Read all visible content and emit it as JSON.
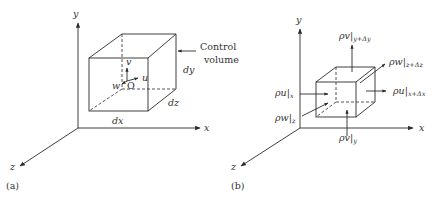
{
  "panel_a": {
    "label": "(a)",
    "axes": {
      "x": "x",
      "y": "y",
      "z": "z"
    },
    "velocity": {
      "u": "u",
      "v": "v",
      "w": "w",
      "origin": "O"
    },
    "dims": {
      "dx": "dx",
      "dy": "dy",
      "dz": "dz"
    },
    "callout": {
      "line1": "Control",
      "line2": "volume"
    }
  },
  "panel_b": {
    "label": "(b)",
    "axes": {
      "x": "x",
      "y": "y",
      "z": "z"
    },
    "fluxes": {
      "rho_u_x": {
        "main": "ρu|",
        "sub": "x"
      },
      "rho_u_xdx": {
        "main": "ρu|",
        "sub": "x+Δx"
      },
      "rho_v_y": {
        "main": "ρv|",
        "sub": "y"
      },
      "rho_v_ydy": {
        "main": "ρv|",
        "sub": "y+Δy"
      },
      "rho_w_z": {
        "main": "ρw|",
        "sub": "z"
      },
      "rho_w_zdz": {
        "main": "ρw|",
        "sub": "z+Δz"
      }
    }
  }
}
